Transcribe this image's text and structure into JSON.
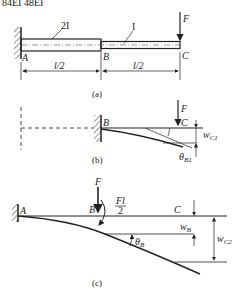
{
  "top_fragment": "84EI   48EI",
  "figure_a": {
    "caption": "(a)",
    "segment_left_label": "2I",
    "segment_right_label": "I",
    "point_A": "A",
    "point_B": "B",
    "point_C": "C",
    "force": "F",
    "dim_left": "l/2",
    "dim_right": "l/2"
  },
  "figure_b": {
    "caption": "(b)",
    "point_B": "B",
    "point_C": "C",
    "force": "F",
    "deflection": "w",
    "deflection_sub": "C1",
    "rotation": "θ",
    "rotation_sub": "B1"
  },
  "figure_c": {
    "caption": "(c)",
    "point_A": "A",
    "point_B": "B",
    "point_C": "C",
    "force": "F",
    "moment_num": "Fl",
    "moment_den": "2",
    "deflection_B": "w",
    "deflection_B_sub": "B",
    "deflection_C": "w",
    "deflection_C_sub": "C2",
    "rotation": "θ",
    "rotation_sub": "B"
  }
}
